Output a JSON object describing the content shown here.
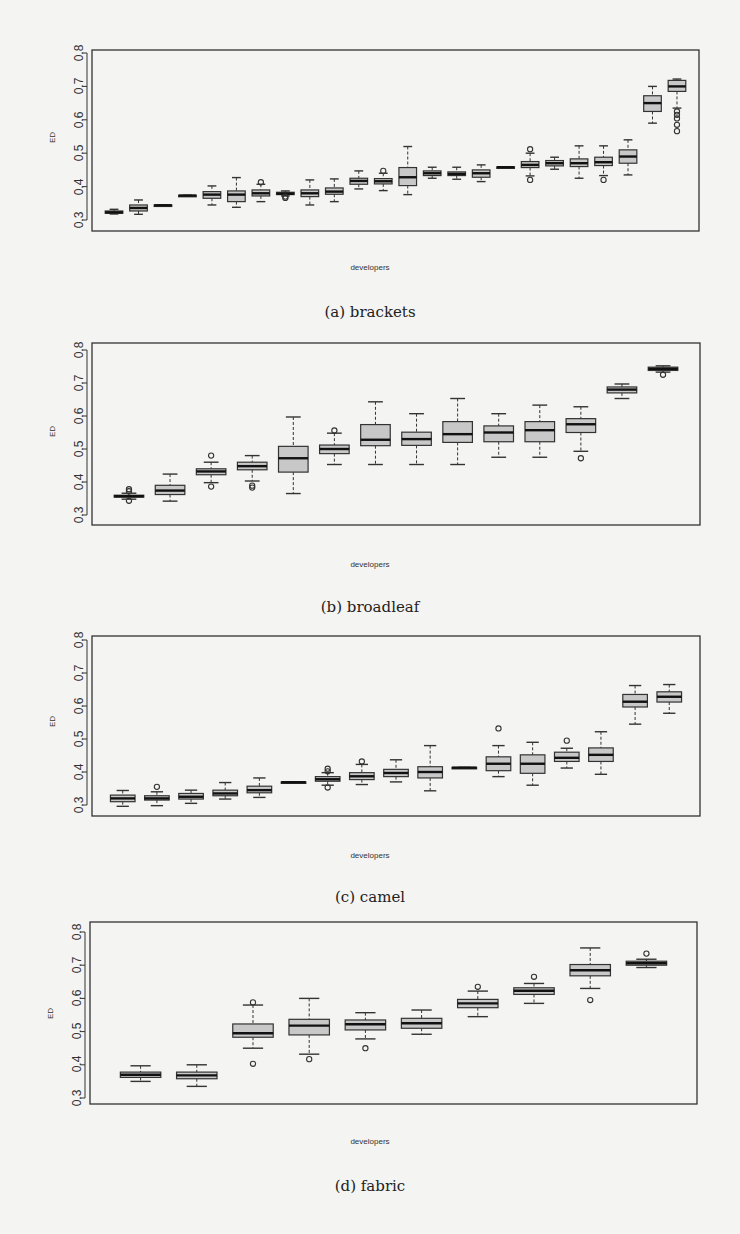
{
  "figure": {
    "subfigures": [
      {
        "id": "a",
        "caption": "(a) brackets",
        "xlabel": "developers",
        "ylabel": "ED"
      },
      {
        "id": "b",
        "caption": "(b) broadleaf",
        "xlabel": "developers",
        "ylabel": "ED"
      },
      {
        "id": "c",
        "caption": "(c) camel",
        "xlabel": "developers",
        "ylabel": "ED"
      },
      {
        "id": "d",
        "caption": "(d) fabric",
        "xlabel": "developers",
        "ylabel": "ED"
      }
    ],
    "yticks": [
      "0.3",
      "0.4",
      "0.5",
      "0.6",
      "0.7",
      "0.8"
    ]
  },
  "colors": {
    "box_fill": "#c8c8c8",
    "stroke": "#333333",
    "background": "#f4f4f2"
  },
  "chart_data": [
    {
      "type": "boxplot",
      "title": "(a) brackets",
      "xlabel": "developers",
      "ylabel": "ED",
      "ylim": [
        0.3,
        0.8
      ],
      "yticks": [
        0.3,
        0.4,
        0.5,
        0.6,
        0.7,
        0.8
      ],
      "grid": false,
      "boxes": [
        {
          "min": 0.318,
          "q1": 0.32,
          "median": 0.323,
          "q3": 0.327,
          "max": 0.332,
          "outliers": []
        },
        {
          "min": 0.317,
          "q1": 0.327,
          "median": 0.336,
          "q3": 0.345,
          "max": 0.36,
          "outliers": []
        },
        {
          "min": 0.343,
          "q1": 0.343,
          "median": 0.344,
          "q3": 0.345,
          "max": 0.345,
          "outliers": []
        },
        {
          "min": 0.372,
          "q1": 0.372,
          "median": 0.373,
          "q3": 0.374,
          "max": 0.374,
          "outliers": []
        },
        {
          "min": 0.345,
          "q1": 0.365,
          "median": 0.376,
          "q3": 0.385,
          "max": 0.402,
          "outliers": []
        },
        {
          "min": 0.338,
          "q1": 0.355,
          "median": 0.376,
          "q3": 0.387,
          "max": 0.427,
          "outliers": []
        },
        {
          "min": 0.355,
          "q1": 0.372,
          "median": 0.38,
          "q3": 0.39,
          "max": 0.407,
          "outliers": [
            0.413
          ]
        },
        {
          "min": 0.372,
          "q1": 0.376,
          "median": 0.379,
          "q3": 0.383,
          "max": 0.387,
          "outliers": [
            0.366,
            0.37
          ]
        },
        {
          "min": 0.345,
          "q1": 0.37,
          "median": 0.38,
          "q3": 0.39,
          "max": 0.42,
          "outliers": []
        },
        {
          "min": 0.355,
          "q1": 0.377,
          "median": 0.385,
          "q3": 0.396,
          "max": 0.423,
          "outliers": []
        },
        {
          "min": 0.393,
          "q1": 0.407,
          "median": 0.417,
          "q3": 0.425,
          "max": 0.447,
          "outliers": []
        },
        {
          "min": 0.388,
          "q1": 0.408,
          "median": 0.416,
          "q3": 0.424,
          "max": 0.44,
          "outliers": [
            0.447
          ]
        },
        {
          "min": 0.376,
          "q1": 0.403,
          "median": 0.428,
          "q3": 0.457,
          "max": 0.52,
          "outliers": []
        },
        {
          "min": 0.425,
          "q1": 0.433,
          "median": 0.44,
          "q3": 0.447,
          "max": 0.458,
          "outliers": []
        },
        {
          "min": 0.422,
          "q1": 0.433,
          "median": 0.438,
          "q3": 0.444,
          "max": 0.458,
          "outliers": []
        },
        {
          "min": 0.415,
          "q1": 0.428,
          "median": 0.44,
          "q3": 0.45,
          "max": 0.465,
          "outliers": []
        },
        {
          "min": 0.457,
          "q1": 0.457,
          "median": 0.458,
          "q3": 0.459,
          "max": 0.459,
          "outliers": []
        },
        {
          "min": 0.432,
          "q1": 0.457,
          "median": 0.465,
          "q3": 0.475,
          "max": 0.5,
          "outliers": [
            0.42,
            0.512
          ]
        },
        {
          "min": 0.452,
          "q1": 0.462,
          "median": 0.47,
          "q3": 0.478,
          "max": 0.488,
          "outliers": []
        },
        {
          "min": 0.425,
          "q1": 0.46,
          "median": 0.47,
          "q3": 0.483,
          "max": 0.522,
          "outliers": []
        },
        {
          "min": 0.433,
          "q1": 0.463,
          "median": 0.473,
          "q3": 0.488,
          "max": 0.522,
          "outliers": [
            0.42
          ]
        },
        {
          "min": 0.435,
          "q1": 0.47,
          "median": 0.49,
          "q3": 0.51,
          "max": 0.54,
          "outliers": []
        },
        {
          "min": 0.59,
          "q1": 0.625,
          "median": 0.65,
          "q3": 0.672,
          "max": 0.7,
          "outliers": []
        },
        {
          "min": 0.635,
          "q1": 0.685,
          "median": 0.7,
          "q3": 0.718,
          "max": 0.722,
          "outliers": [
            0.566,
            0.585,
            0.604,
            0.615,
            0.625
          ]
        }
      ]
    },
    {
      "type": "boxplot",
      "title": "(b) broadleaf",
      "xlabel": "developers",
      "ylabel": "ED",
      "ylim": [
        0.3,
        0.8
      ],
      "yticks": [
        0.3,
        0.4,
        0.5,
        0.6,
        0.7,
        0.8
      ],
      "grid": false,
      "boxes": [
        {
          "min": 0.348,
          "q1": 0.354,
          "median": 0.357,
          "q3": 0.36,
          "max": 0.366,
          "outliers": [
            0.343,
            0.372,
            0.378
          ]
        },
        {
          "min": 0.342,
          "q1": 0.362,
          "median": 0.374,
          "q3": 0.39,
          "max": 0.424,
          "outliers": []
        },
        {
          "min": 0.398,
          "q1": 0.422,
          "median": 0.432,
          "q3": 0.44,
          "max": 0.46,
          "outliers": [
            0.386,
            0.48
          ]
        },
        {
          "min": 0.403,
          "q1": 0.437,
          "median": 0.448,
          "q3": 0.46,
          "max": 0.48,
          "outliers": [
            0.383,
            0.389
          ]
        },
        {
          "min": 0.365,
          "q1": 0.43,
          "median": 0.472,
          "q3": 0.508,
          "max": 0.597,
          "outliers": []
        },
        {
          "min": 0.453,
          "q1": 0.486,
          "median": 0.5,
          "q3": 0.512,
          "max": 0.548,
          "outliers": [
            0.556
          ]
        },
        {
          "min": 0.453,
          "q1": 0.51,
          "median": 0.528,
          "q3": 0.574,
          "max": 0.643,
          "outliers": []
        },
        {
          "min": 0.453,
          "q1": 0.511,
          "median": 0.53,
          "q3": 0.551,
          "max": 0.607,
          "outliers": []
        },
        {
          "min": 0.453,
          "q1": 0.52,
          "median": 0.545,
          "q3": 0.583,
          "max": 0.653,
          "outliers": []
        },
        {
          "min": 0.475,
          "q1": 0.522,
          "median": 0.55,
          "q3": 0.57,
          "max": 0.607,
          "outliers": []
        },
        {
          "min": 0.475,
          "q1": 0.522,
          "median": 0.557,
          "q3": 0.583,
          "max": 0.633,
          "outliers": []
        },
        {
          "min": 0.493,
          "q1": 0.55,
          "median": 0.575,
          "q3": 0.592,
          "max": 0.628,
          "outliers": [
            0.472
          ]
        },
        {
          "min": 0.653,
          "q1": 0.67,
          "median": 0.68,
          "q3": 0.688,
          "max": 0.697,
          "outliers": []
        },
        {
          "min": 0.733,
          "q1": 0.738,
          "median": 0.743,
          "q3": 0.748,
          "max": 0.752,
          "outliers": [
            0.725
          ]
        }
      ]
    },
    {
      "type": "boxplot",
      "title": "(c) camel",
      "xlabel": "developers",
      "ylabel": "ED",
      "ylim": [
        0.3,
        0.8
      ],
      "yticks": [
        0.3,
        0.4,
        0.5,
        0.6,
        0.7,
        0.8
      ],
      "grid": false,
      "boxes": [
        {
          "min": 0.296,
          "q1": 0.31,
          "median": 0.32,
          "q3": 0.33,
          "max": 0.344,
          "outliers": []
        },
        {
          "min": 0.298,
          "q1": 0.315,
          "median": 0.32,
          "q3": 0.328,
          "max": 0.34,
          "outliers": [
            0.355
          ]
        },
        {
          "min": 0.305,
          "q1": 0.318,
          "median": 0.325,
          "q3": 0.335,
          "max": 0.345,
          "outliers": []
        },
        {
          "min": 0.318,
          "q1": 0.328,
          "median": 0.335,
          "q3": 0.345,
          "max": 0.368,
          "outliers": []
        },
        {
          "min": 0.323,
          "q1": 0.337,
          "median": 0.345,
          "q3": 0.357,
          "max": 0.382,
          "outliers": []
        },
        {
          "min": 0.368,
          "q1": 0.368,
          "median": 0.369,
          "q3": 0.37,
          "max": 0.37,
          "outliers": []
        },
        {
          "min": 0.36,
          "q1": 0.372,
          "median": 0.378,
          "q3": 0.386,
          "max": 0.398,
          "outliers": [
            0.353,
            0.402,
            0.41
          ]
        },
        {
          "min": 0.362,
          "q1": 0.377,
          "median": 0.387,
          "q3": 0.398,
          "max": 0.423,
          "outliers": [
            0.432
          ]
        },
        {
          "min": 0.37,
          "q1": 0.386,
          "median": 0.397,
          "q3": 0.408,
          "max": 0.437,
          "outliers": []
        },
        {
          "min": 0.343,
          "q1": 0.382,
          "median": 0.4,
          "q3": 0.416,
          "max": 0.48,
          "outliers": []
        },
        {
          "min": 0.412,
          "q1": 0.412,
          "median": 0.413,
          "q3": 0.414,
          "max": 0.414,
          "outliers": []
        },
        {
          "min": 0.386,
          "q1": 0.404,
          "median": 0.425,
          "q3": 0.446,
          "max": 0.48,
          "outliers": [
            0.532
          ]
        },
        {
          "min": 0.36,
          "q1": 0.396,
          "median": 0.425,
          "q3": 0.452,
          "max": 0.49,
          "outliers": []
        },
        {
          "min": 0.412,
          "q1": 0.432,
          "median": 0.443,
          "q3": 0.46,
          "max": 0.472,
          "outliers": [
            0.495
          ]
        },
        {
          "min": 0.393,
          "q1": 0.432,
          "median": 0.452,
          "q3": 0.473,
          "max": 0.522,
          "outliers": []
        },
        {
          "min": 0.545,
          "q1": 0.597,
          "median": 0.613,
          "q3": 0.635,
          "max": 0.662,
          "outliers": []
        },
        {
          "min": 0.578,
          "q1": 0.612,
          "median": 0.628,
          "q3": 0.643,
          "max": 0.665,
          "outliers": []
        }
      ]
    },
    {
      "type": "boxplot",
      "title": "(d) fabric",
      "xlabel": "developers",
      "ylabel": "ED",
      "ylim": [
        0.3,
        0.8
      ],
      "yticks": [
        0.3,
        0.4,
        0.5,
        0.6,
        0.7,
        0.8
      ],
      "grid": false,
      "boxes": [
        {
          "min": 0.35,
          "q1": 0.362,
          "median": 0.37,
          "q3": 0.378,
          "max": 0.397,
          "outliers": []
        },
        {
          "min": 0.335,
          "q1": 0.358,
          "median": 0.368,
          "q3": 0.378,
          "max": 0.4,
          "outliers": []
        },
        {
          "min": 0.45,
          "q1": 0.483,
          "median": 0.495,
          "q3": 0.523,
          "max": 0.58,
          "outliers": [
            0.403,
            0.588
          ]
        },
        {
          "min": 0.432,
          "q1": 0.49,
          "median": 0.518,
          "q3": 0.537,
          "max": 0.6,
          "outliers": [
            0.417
          ]
        },
        {
          "min": 0.478,
          "q1": 0.505,
          "median": 0.522,
          "q3": 0.535,
          "max": 0.557,
          "outliers": [
            0.45
          ]
        },
        {
          "min": 0.492,
          "q1": 0.51,
          "median": 0.525,
          "q3": 0.54,
          "max": 0.565,
          "outliers": []
        },
        {
          "min": 0.545,
          "q1": 0.572,
          "median": 0.585,
          "q3": 0.597,
          "max": 0.622,
          "outliers": [
            0.635
          ]
        },
        {
          "min": 0.585,
          "q1": 0.612,
          "median": 0.623,
          "q3": 0.632,
          "max": 0.645,
          "outliers": [
            0.665
          ]
        },
        {
          "min": 0.63,
          "q1": 0.668,
          "median": 0.685,
          "q3": 0.702,
          "max": 0.752,
          "outliers": [
            0.595
          ]
        },
        {
          "min": 0.693,
          "q1": 0.7,
          "median": 0.706,
          "q3": 0.712,
          "max": 0.718,
          "outliers": [
            0.735
          ]
        }
      ]
    }
  ]
}
